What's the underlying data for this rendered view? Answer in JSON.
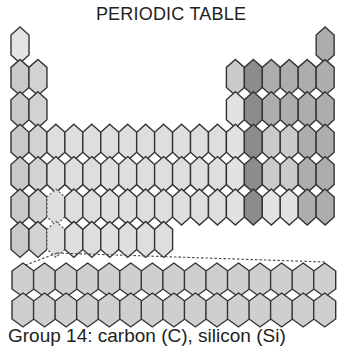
{
  "title": "PERIODIC TABLE",
  "caption": "Group 14: carbon (C), silicon (Si)",
  "colors": {
    "s1": "#c9c9c9",
    "s2": "#d2d2d2",
    "d": "#dedede",
    "f": "#cfcfcf",
    "p_light": "#e2e2e2",
    "p_group14": "#8c8c8c",
    "p_mid": "#adadad",
    "p_lightmid": "#cacaca",
    "h": "#e4e4e4",
    "stroke": "#333333"
  },
  "grid": {
    "x0": 11,
    "col_pitch": 17.95,
    "hex_w": 18,
    "y0": 27,
    "row_pitch": 32.4,
    "hex_h": 36,
    "tip": 8
  },
  "main_table": {
    "rows": [
      {
        "period": 1,
        "cells": [
          {
            "col": 1,
            "c": "h"
          },
          {
            "col": 18,
            "c": "p_mid"
          }
        ]
      },
      {
        "period": 2,
        "cells": [
          {
            "col": 1,
            "c": "s1"
          },
          {
            "col": 2,
            "c": "s2"
          },
          {
            "col": 13,
            "c": "p_lightmid"
          },
          {
            "col": 14,
            "c": "p_group14"
          },
          {
            "col": 15,
            "c": "p_mid"
          },
          {
            "col": 16,
            "c": "p_mid"
          },
          {
            "col": 17,
            "c": "p_mid"
          },
          {
            "col": 18,
            "c": "p_mid"
          }
        ]
      },
      {
        "period": 3,
        "cells": [
          {
            "col": 1,
            "c": "s1"
          },
          {
            "col": 2,
            "c": "s2"
          },
          {
            "col": 13,
            "c": "p_light"
          },
          {
            "col": 14,
            "c": "p_group14"
          },
          {
            "col": 15,
            "c": "p_mid"
          },
          {
            "col": 16,
            "c": "p_mid"
          },
          {
            "col": 17,
            "c": "p_mid"
          },
          {
            "col": 18,
            "c": "p_mid"
          }
        ]
      },
      {
        "period": 4,
        "cells": [
          {
            "col": 1,
            "c": "s1"
          },
          {
            "col": 2,
            "c": "s2"
          },
          {
            "col": 3,
            "c": "d"
          },
          {
            "col": 4,
            "c": "d"
          },
          {
            "col": 5,
            "c": "d"
          },
          {
            "col": 6,
            "c": "d"
          },
          {
            "col": 7,
            "c": "d"
          },
          {
            "col": 8,
            "c": "d"
          },
          {
            "col": 9,
            "c": "d"
          },
          {
            "col": 10,
            "c": "d"
          },
          {
            "col": 11,
            "c": "d"
          },
          {
            "col": 12,
            "c": "d"
          },
          {
            "col": 13,
            "c": "p_light"
          },
          {
            "col": 14,
            "c": "p_group14"
          },
          {
            "col": 15,
            "c": "p_lightmid"
          },
          {
            "col": 16,
            "c": "p_lightmid"
          },
          {
            "col": 17,
            "c": "p_mid"
          },
          {
            "col": 18,
            "c": "p_mid"
          }
        ]
      },
      {
        "period": 5,
        "cells": [
          {
            "col": 1,
            "c": "s1"
          },
          {
            "col": 2,
            "c": "s2"
          },
          {
            "col": 3,
            "c": "d"
          },
          {
            "col": 4,
            "c": "d"
          },
          {
            "col": 5,
            "c": "d"
          },
          {
            "col": 6,
            "c": "d"
          },
          {
            "col": 7,
            "c": "d"
          },
          {
            "col": 8,
            "c": "d"
          },
          {
            "col": 9,
            "c": "d"
          },
          {
            "col": 10,
            "c": "d"
          },
          {
            "col": 11,
            "c": "d"
          },
          {
            "col": 12,
            "c": "d"
          },
          {
            "col": 13,
            "c": "p_light"
          },
          {
            "col": 14,
            "c": "p_group14"
          },
          {
            "col": 15,
            "c": "p_lightmid"
          },
          {
            "col": 16,
            "c": "p_lightmid"
          },
          {
            "col": 17,
            "c": "p_mid"
          },
          {
            "col": 18,
            "c": "p_mid"
          }
        ]
      },
      {
        "period": 6,
        "cells": [
          {
            "col": 1,
            "c": "s1"
          },
          {
            "col": 2,
            "c": "s2"
          },
          {
            "col": 3,
            "c": "d",
            "dashed": true
          },
          {
            "col": 4,
            "c": "d"
          },
          {
            "col": 5,
            "c": "d"
          },
          {
            "col": 6,
            "c": "d"
          },
          {
            "col": 7,
            "c": "d"
          },
          {
            "col": 8,
            "c": "d"
          },
          {
            "col": 9,
            "c": "d"
          },
          {
            "col": 10,
            "c": "d"
          },
          {
            "col": 11,
            "c": "d"
          },
          {
            "col": 12,
            "c": "d"
          },
          {
            "col": 13,
            "c": "p_light"
          },
          {
            "col": 14,
            "c": "p_group14"
          },
          {
            "col": 15,
            "c": "p_light"
          },
          {
            "col": 16,
            "c": "p_light"
          },
          {
            "col": 17,
            "c": "p_mid"
          },
          {
            "col": 18,
            "c": "p_mid"
          }
        ]
      },
      {
        "period": 7,
        "cells": [
          {
            "col": 1,
            "c": "s1"
          },
          {
            "col": 2,
            "c": "s2"
          },
          {
            "col": 3,
            "c": "d",
            "dashed": true
          },
          {
            "col": 4,
            "c": "d"
          },
          {
            "col": 5,
            "c": "d"
          },
          {
            "col": 6,
            "c": "d"
          },
          {
            "col": 7,
            "c": "d"
          },
          {
            "col": 8,
            "c": "d"
          },
          {
            "col": 9,
            "c": "d"
          }
        ]
      }
    ]
  },
  "f_block": {
    "x0": 12,
    "col_pitch": 21.55,
    "hex_w": 22,
    "y0": 263,
    "row_pitch": 30,
    "hex_h": 34,
    "tip": 8,
    "columns": 15,
    "rows": 2,
    "color": "f"
  },
  "connector": {
    "apex": [
      57,
      253
    ],
    "left_end": [
      13,
      270
    ],
    "right_end": [
      325,
      262
    ]
  }
}
